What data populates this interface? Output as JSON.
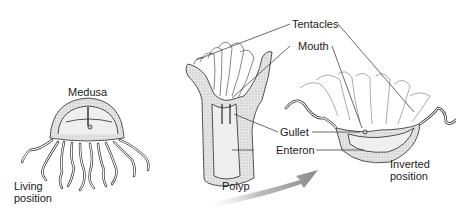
{
  "diagram": {
    "type": "biology-illustration",
    "figures": [
      {
        "id": "medusa",
        "title": "Medusa",
        "caption_lines": [
          "Living",
          "position"
        ]
      },
      {
        "id": "polyp",
        "title": "Polyp"
      },
      {
        "id": "inverted-medusa",
        "caption_lines": [
          "Inverted",
          "position"
        ]
      }
    ],
    "labels": {
      "medusa": "Medusa",
      "living_1": "Living",
      "living_2": "position",
      "tentacles": "Tentacles",
      "mouth": "Mouth",
      "gullet": "Gullet",
      "enteron": "Enteron",
      "polyp": "Polyp",
      "inverted_1": "Inverted",
      "inverted_2": "position"
    },
    "colors": {
      "line": "#2a2a2a",
      "fill_light": "#ececec",
      "fill_stipple": "#d4d4d4",
      "arrow": "#9a9a9a"
    }
  }
}
